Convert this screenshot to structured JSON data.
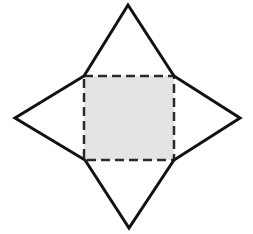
{
  "figure": {
    "canvas": {
      "width": 253,
      "height": 234,
      "background_color": "#ffffff"
    },
    "star": {
      "name": "four-pointed-star",
      "stroke_color": "#111111",
      "stroke_width": 3,
      "fill_color": "none",
      "outer_points": [
        {
          "label": "top-point",
          "x": 128,
          "y": 5
        },
        {
          "label": "right-point",
          "x": 240,
          "y": 118
        },
        {
          "label": "bottom-point",
          "x": 129,
          "y": 228
        },
        {
          "label": "left-point",
          "x": 15,
          "y": 118
        }
      ],
      "inner_points": [
        {
          "label": "top-right-inner",
          "x": 174,
          "y": 76
        },
        {
          "label": "bottom-right-inner",
          "x": 174,
          "y": 160
        },
        {
          "label": "bottom-left-inner",
          "x": 85,
          "y": 160
        },
        {
          "label": "top-left-inner",
          "x": 84,
          "y": 76
        }
      ],
      "path_points": "128,5 174,76 240,118 174,160 129,228 85,160 15,118 84,76"
    },
    "dashed_square": {
      "name": "shaded-dashed-square",
      "x": 84,
      "y": 76,
      "width": 90,
      "height": 84,
      "fill_color": "#e4e4e4",
      "stroke_color": "#2b2b2b",
      "stroke_width": 2.5,
      "dash_on": 9,
      "dash_off": 5,
      "dash_array": "9 5"
    }
  },
  "chart_data": {
    "type": "diagram",
    "shapes": [
      {
        "name": "four-pointed-star",
        "kind": "polygon",
        "vertex_count": 8,
        "vertices": [
          [
            128,
            5
          ],
          [
            174,
            76
          ],
          [
            240,
            118
          ],
          [
            174,
            160
          ],
          [
            129,
            228
          ],
          [
            85,
            160
          ],
          [
            15,
            118
          ],
          [
            84,
            76
          ]
        ],
        "fill": "none",
        "stroke": "#111111",
        "stroke_width": 3,
        "line_style": "solid"
      },
      {
        "name": "shaded-dashed-square",
        "kind": "rectangle",
        "vertices": [
          [
            84,
            76
          ],
          [
            174,
            76
          ],
          [
            174,
            160
          ],
          [
            84,
            160
          ]
        ],
        "fill": "#e4e4e4",
        "stroke": "#2b2b2b",
        "stroke_width": 2.5,
        "line_style": "dashed"
      }
    ]
  }
}
